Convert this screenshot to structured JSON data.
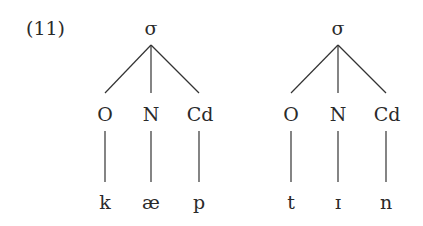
{
  "example_number": "(11)",
  "trees": [
    {
      "root": "σ",
      "children": [
        {
          "label": "O",
          "segment": "k"
        },
        {
          "label": "N",
          "segment": "æ"
        },
        {
          "label": "Cd",
          "segment": "p"
        }
      ]
    },
    {
      "root": "σ",
      "children": [
        {
          "label": "O",
          "segment": "t"
        },
        {
          "label": "N",
          "segment": "ɪ"
        },
        {
          "label": "Cd",
          "segment": "n"
        }
      ]
    }
  ]
}
